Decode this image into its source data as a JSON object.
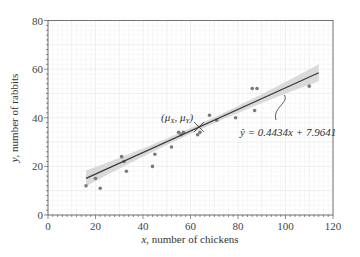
{
  "chart_data": {
    "type": "scatter",
    "title": "",
    "xlabel": "x, number of chickens",
    "ylabel": "y, number of rabbits",
    "xlim": [
      0,
      120
    ],
    "ylim": [
      0,
      80
    ],
    "xticks": [
      0,
      20,
      40,
      60,
      80,
      100,
      120
    ],
    "yticks": [
      0,
      20,
      40,
      60,
      80
    ],
    "grid": true,
    "legend": null,
    "series": [
      {
        "name": "observations",
        "points": [
          [
            16,
            12
          ],
          [
            20,
            15
          ],
          [
            22,
            11
          ],
          [
            31,
            24
          ],
          [
            32,
            22
          ],
          [
            33,
            18
          ],
          [
            44,
            20
          ],
          [
            45,
            25
          ],
          [
            52,
            28
          ],
          [
            55,
            34
          ],
          [
            56,
            33
          ],
          [
            57,
            34
          ],
          [
            63,
            33
          ],
          [
            64,
            34
          ],
          [
            68,
            41
          ],
          [
            71,
            39
          ],
          [
            79,
            40
          ],
          [
            87,
            43
          ],
          [
            86,
            52
          ],
          [
            88,
            52
          ],
          [
            110,
            53
          ]
        ]
      }
    ],
    "regression": {
      "slope": 0.4434,
      "intercept": 7.9641,
      "x_range": [
        16,
        114
      ],
      "confidence_band": true,
      "equation_label": "ŷ = 0.4434x + 7.9641"
    },
    "annotations": [
      {
        "text": "(μX, μY)",
        "x": 63.6,
        "y": 36.2,
        "marker": "x"
      },
      {
        "text": "ŷ = 0.4434x + 7.9641",
        "pointer_to_line": true
      }
    ],
    "colors": {
      "points": "#7a7a7a",
      "line": "#3a3a3a",
      "band": "#d3d3d3",
      "grid": "#ececec",
      "axis": "#333333"
    }
  },
  "labels": {
    "xlabel_var": "x",
    "xlabel_rest": ", number of chickens",
    "ylabel_var": "y",
    "ylabel_rest": ", number of rabbits",
    "mean_label": "(μX, μY)",
    "equation": "ŷ = 0.4434x + 7.9641"
  }
}
